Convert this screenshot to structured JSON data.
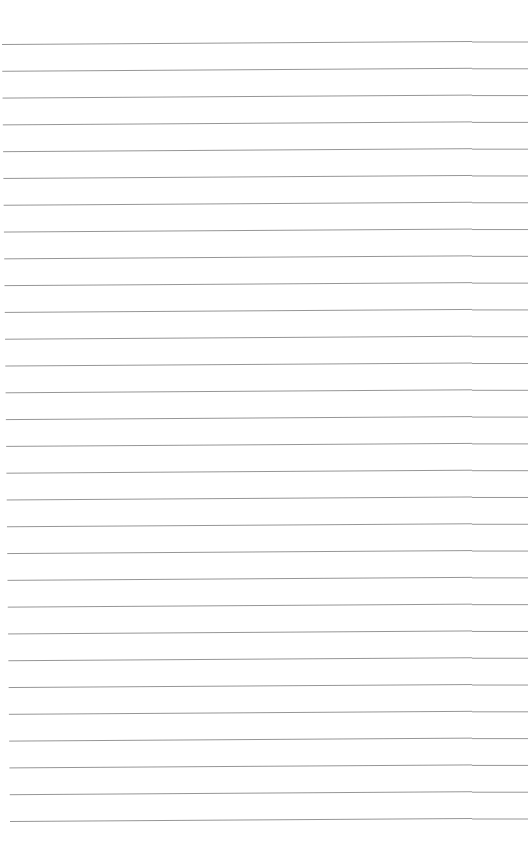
{
  "page": {
    "type": "lined-paper",
    "width": 530,
    "height": 867,
    "background": "#ffffff",
    "line_color": "#8a8a8a",
    "line_count": 30,
    "first_line_y": 43,
    "last_line_y": 820,
    "line_start_x_top": 2,
    "line_start_x_bottom": 10,
    "line_end_x": 528,
    "segment_break_x": 472,
    "tilt_px": 3
  }
}
